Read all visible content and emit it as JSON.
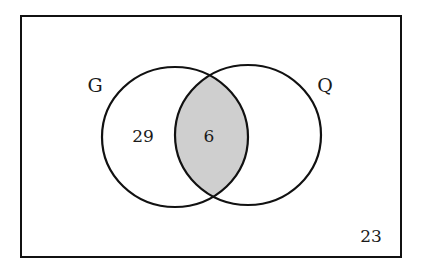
{
  "diagram": {
    "type": "venn",
    "universe": {
      "outside_count": "23"
    },
    "sets": [
      {
        "name": "G",
        "only_count": "29"
      },
      {
        "name": "Q",
        "only_count": ""
      }
    ],
    "intersection": {
      "label": "G ∩ Q",
      "count": "6",
      "shaded": true
    },
    "colors": {
      "stroke": "#111111",
      "shade": "#cfcfcf",
      "background": "#ffffff"
    }
  }
}
